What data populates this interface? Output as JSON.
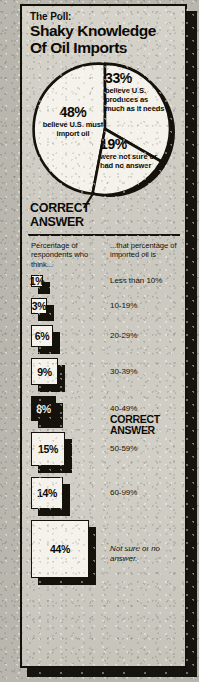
{
  "header": {
    "kicker": "The Poll:",
    "title_line1": "Shaky Knowledge",
    "title_line2": "Of Oil Imports"
  },
  "callout": {
    "line1": "CORRECT",
    "line2": "ANSWER"
  },
  "table": {
    "header_left": "Percentage of respondents who think...",
    "header_right": "...that percentage of imported oil is"
  },
  "chart_data": [
    {
      "type": "pie",
      "title": "Shaky Knowledge Of Oil Imports",
      "categories": [
        "48%",
        "33%",
        "19%"
      ],
      "values": [
        48,
        33,
        19
      ],
      "labels": [
        {
          "pct": "48%",
          "text": "believe U.S. must import oil"
        },
        {
          "pct": "33%",
          "text": "believe U.S. produces as much as it needs"
        },
        {
          "pct": "19%",
          "text": "were not sure or had no answer"
        }
      ],
      "legend": "none",
      "grid": false
    },
    {
      "type": "bar",
      "title": "Percentage of respondents who think...",
      "xlabel": "...that percentage of imported oil is",
      "ylabel": "Percentage of respondents",
      "categories": [
        "Less than 10%",
        "10-19%",
        "20-29%",
        "30-39%",
        "40-49%",
        "50-59%",
        "60-99%",
        "Not sure or no answer."
      ],
      "values": [
        1,
        3,
        6,
        9,
        8,
        15,
        14,
        44
      ],
      "value_labels": [
        "1%",
        "3%",
        "6%",
        "9%",
        "8%",
        "15%",
        "14%",
        "44%"
      ],
      "correct_answer_index": 4,
      "correct_answer_label": "CORRECT ANSWER",
      "ylim": [
        0,
        44
      ]
    }
  ],
  "rows": [
    {
      "value": "1%",
      "label": "Less than 10%",
      "size": 12,
      "dark": false,
      "italic": false,
      "correct": ""
    },
    {
      "value": "3%",
      "label": "10-19%",
      "size": 16,
      "dark": false,
      "italic": false,
      "correct": ""
    },
    {
      "value": "6%",
      "label": "20-29%",
      "size": 22,
      "dark": false,
      "italic": false,
      "correct": ""
    },
    {
      "value": "9%",
      "label": "30-39%",
      "size": 27,
      "dark": false,
      "italic": false,
      "correct": ""
    },
    {
      "value": "8%",
      "label": "40-49%",
      "size": 25,
      "dark": true,
      "italic": false,
      "correct": "CORRECT ANSWER"
    },
    {
      "value": "15%",
      "label": "50-59%",
      "size": 34,
      "dark": false,
      "italic": false,
      "correct": ""
    },
    {
      "value": "14%",
      "label": "60-99%",
      "size": 32,
      "dark": false,
      "italic": false,
      "correct": ""
    },
    {
      "value": "44%",
      "label": "Not sure or no answer.",
      "size": 58,
      "dark": false,
      "italic": true,
      "correct": ""
    }
  ],
  "colors": {
    "ink": "#14120a",
    "paper": "#d2cfc6",
    "box_fill": "#f4f2ea"
  }
}
